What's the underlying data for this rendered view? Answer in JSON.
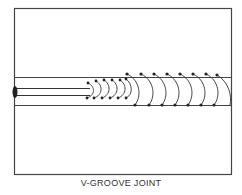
{
  "figure": {
    "caption": "V-GROOVE JOINT",
    "colors": {
      "line": "#333333",
      "background": "#ffffff"
    }
  }
}
